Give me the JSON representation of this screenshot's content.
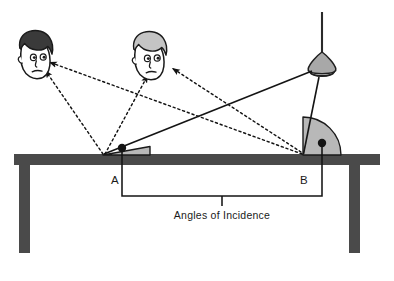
{
  "diagram": {
    "title_caption": "Angles of Incidence",
    "point_labels": {
      "a": "A",
      "b": "B"
    },
    "objects": {
      "lamp": "hanging-lamp",
      "table": "table",
      "head_left": "person-head-dark-hair",
      "head_right": "person-head-light-hair",
      "mirror_surface": "table-top-reflective-surface"
    },
    "rays": {
      "incident_label": "incident-ray",
      "reflected_label": "reflected-ray",
      "incident_count": 2,
      "reflected_count": 4
    },
    "angles": {
      "a_wedge": "small-angle-of-incidence-at-A",
      "b_wedge": "large-angle-of-incidence-at-B"
    },
    "colors": {
      "table": "#4a4a4a",
      "wedge_fill": "#b8b8b8",
      "lamp_shade": "#a8a8a8",
      "hair_dark": "#3a3a3a",
      "hair_light": "#c4c4c4",
      "line": "#1a1a1a",
      "background": "#ffffff",
      "skin": "#ffffff"
    }
  }
}
